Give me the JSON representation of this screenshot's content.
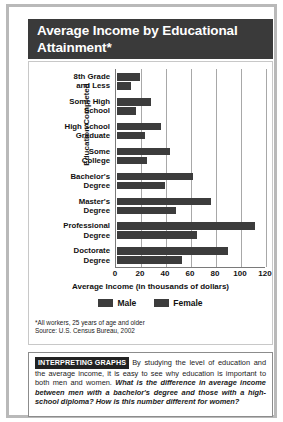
{
  "title": "Average Income by Educational Attainment*",
  "chart_data": {
    "type": "bar",
    "orientation": "horizontal",
    "title": "Average Income by Educational Attainment*",
    "xlabel": "Average Income (in thousands of dollars)",
    "ylabel": "Education Completed",
    "xlim": [
      0,
      120
    ],
    "xticks": [
      0,
      20,
      40,
      60,
      80,
      100,
      120
    ],
    "grid": true,
    "legend_position": "bottom",
    "categories": [
      "8th Grade and Less",
      "Some High School",
      "High School Graduate",
      "Some College",
      "Bachelor's Degree",
      "Master's Degree",
      "Professional Degree",
      "Doctorate Degree"
    ],
    "category_lines": [
      [
        "8th Grade",
        "and Less"
      ],
      [
        "Some High",
        "School"
      ],
      [
        "High School",
        "Graduate"
      ],
      [
        "Some",
        "College"
      ],
      [
        "Bachelor's",
        "Degree"
      ],
      [
        "Master's",
        "Degree"
      ],
      [
        "Professional",
        "Degree"
      ],
      [
        "Doctorate",
        "Degree"
      ]
    ],
    "series": [
      {
        "name": "Male",
        "color": "#3c3c3c",
        "values": [
          18,
          27,
          35,
          42,
          61,
          75,
          110,
          89
        ]
      },
      {
        "name": "Female",
        "color": "#3c3c3c",
        "values": [
          11,
          15,
          22,
          24,
          38,
          47,
          64,
          52
        ]
      }
    ]
  },
  "legend": [
    {
      "label": "Male"
    },
    {
      "label": "Female"
    }
  ],
  "notes": [
    "*All workers, 25 years of age and older",
    "Source: U.S. Census Bureau, 2002"
  ],
  "interpreting": {
    "tag": "INTERPRETING GRAPHS",
    "text": "By studying the level of education and the average income, it is easy to see why education is important to both men and women.",
    "question": "What is the difference in average income between men with a bachelor's degree and those with a high-school diploma? How is this number different for women?"
  }
}
